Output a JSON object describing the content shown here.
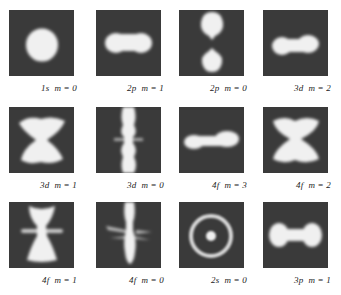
{
  "figure": {
    "colors": {
      "panel_bg": "#3a3a3a",
      "density": "#f2f2f2",
      "page_bg": "#ffffff"
    },
    "panels": [
      {
        "orbital": "1s",
        "m_label": "m = 0",
        "shape": "sphere"
      },
      {
        "orbital": "2p",
        "m_label": "m = 1",
        "shape": "horizontal-peanut"
      },
      {
        "orbital": "2p",
        "m_label": "m = 0",
        "shape": "vertical-two-lobes"
      },
      {
        "orbital": "3d",
        "m_label": "m = 2",
        "shape": "horizontal-peanut"
      },
      {
        "orbital": "3d",
        "m_label": "m = 1",
        "shape": "hourglass"
      },
      {
        "orbital": "3d",
        "m_label": "m = 0",
        "shape": "vertical-column-with-ring"
      },
      {
        "orbital": "4f",
        "m_label": "m = 3",
        "shape": "horizontal-peanut-long"
      },
      {
        "orbital": "4f",
        "m_label": "m = 2",
        "shape": "hourglass-wide"
      },
      {
        "orbital": "4f",
        "m_label": "m = 1",
        "shape": "hourglass-with-ring"
      },
      {
        "orbital": "4f",
        "m_label": "m = 0",
        "shape": "vertical-column-with-rings"
      },
      {
        "orbital": "2s",
        "m_label": "m = 0",
        "shape": "ring-with-core"
      },
      {
        "orbital": "3p",
        "m_label": "m = 1",
        "shape": "dumbbell"
      }
    ]
  }
}
